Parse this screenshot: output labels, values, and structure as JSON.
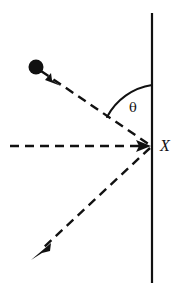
{
  "figure": {
    "kind": "physics-reflection-diagram",
    "width": 180,
    "height": 294,
    "background_color": "#ffffff",
    "ink_color": "#111111"
  },
  "labels": {
    "vertex_point": "X",
    "angle": "θ"
  },
  "elements": {
    "surface_line": {
      "name": "vertical-surface-line",
      "style": "solid",
      "x": 152,
      "y_top": 13,
      "y_bottom": 283,
      "stroke_width": 2.2
    },
    "normal_line": {
      "name": "horizontal-dashed-normal",
      "style": "dashed",
      "x_start": 10,
      "x_end": 149,
      "y": 146,
      "stroke_width": 2.6,
      "dash": "9 6",
      "arrowhead": true
    },
    "incoming_ray": {
      "name": "incoming-dashed-ray",
      "style": "dashed",
      "from_x": 40,
      "from_y": 70,
      "to_x": 150,
      "to_y": 145,
      "stroke_width": 2.4,
      "dash": "9 6",
      "arrowhead_at_x": 57,
      "arrowhead_at_y": 82
    },
    "outgoing_ray": {
      "name": "outgoing-dashed-ray",
      "style": "dashed",
      "from_x": 150,
      "from_y": 148,
      "to_x": 38,
      "to_y": 253,
      "stroke_width": 2.4,
      "dash": "9 6",
      "arrowhead_at_x": 33,
      "arrowhead_at_y": 258
    },
    "ball": {
      "name": "particle-ball",
      "center_x": 36,
      "center_y": 67,
      "radius": 7.5,
      "fill": "#111111"
    },
    "angle_arc": {
      "name": "angle-arc",
      "center_x": 152,
      "center_y": 146,
      "radius": 61,
      "start_x": 152,
      "start_y": 85,
      "end_x": 107,
      "end_y": 117,
      "stroke_width": 2.0
    },
    "vertex_label": {
      "name": "vertex-label-x",
      "x": 160,
      "y": 147,
      "font_size": 16
    },
    "angle_label": {
      "name": "angle-label-theta",
      "x": 133,
      "y": 108,
      "font_size": 13
    }
  }
}
